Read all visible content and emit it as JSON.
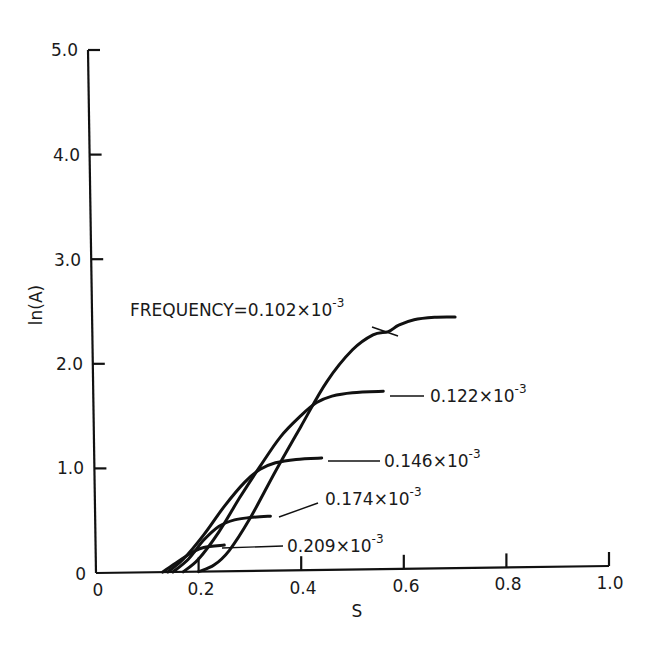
{
  "chart_data": {
    "type": "line",
    "title": "",
    "xlabel": "S",
    "ylabel": "ln(A)",
    "xlim": [
      0,
      1.0
    ],
    "ylim": [
      0,
      5.0
    ],
    "grid": false,
    "legend": "none (inline annotations with leader lines)",
    "x_ticks": [
      "0",
      "0.2",
      "0.4",
      "0.6",
      "0.8",
      "1.0"
    ],
    "x_tick_values": [
      0,
      0.2,
      0.4,
      0.6,
      0.8,
      1.0
    ],
    "y_ticks": [
      "0",
      "1.0",
      "2.0",
      "3.0",
      "4.0",
      "5.0"
    ],
    "y_tick_values": [
      0,
      1.0,
      2.0,
      3.0,
      4.0,
      5.0
    ],
    "series": [
      {
        "name": "0.102×10^-3",
        "label": "FREQUENCY=0.102×10",
        "exponent": "-3",
        "points": [
          [
            0.2,
            0.0
          ],
          [
            0.23,
            0.06
          ],
          [
            0.26,
            0.2
          ],
          [
            0.3,
            0.5
          ],
          [
            0.35,
            0.95
          ],
          [
            0.4,
            1.38
          ],
          [
            0.45,
            1.8
          ],
          [
            0.5,
            2.1
          ],
          [
            0.54,
            2.24
          ],
          [
            0.57,
            2.27
          ],
          [
            0.59,
            2.33
          ],
          [
            0.62,
            2.38
          ],
          [
            0.66,
            2.4
          ],
          [
            0.7,
            2.4
          ]
        ]
      },
      {
        "name": "0.122×10^-3",
        "label": "0.122×10",
        "exponent": "-3",
        "points": [
          [
            0.17,
            0.0
          ],
          [
            0.2,
            0.12
          ],
          [
            0.24,
            0.38
          ],
          [
            0.28,
            0.7
          ],
          [
            0.32,
            1.0
          ],
          [
            0.36,
            1.28
          ],
          [
            0.4,
            1.48
          ],
          [
            0.43,
            1.6
          ],
          [
            0.46,
            1.66
          ],
          [
            0.5,
            1.69
          ],
          [
            0.56,
            1.7
          ]
        ]
      },
      {
        "name": "0.146×10^-3",
        "label": "0.146×10",
        "exponent": "-3",
        "points": [
          [
            0.14,
            0.0
          ],
          [
            0.17,
            0.12
          ],
          [
            0.21,
            0.35
          ],
          [
            0.25,
            0.62
          ],
          [
            0.29,
            0.85
          ],
          [
            0.32,
            0.97
          ],
          [
            0.35,
            1.03
          ],
          [
            0.39,
            1.06
          ],
          [
            0.44,
            1.07
          ]
        ]
      },
      {
        "name": "0.174×10^-3",
        "label": "0.174×10",
        "exponent": "-3",
        "points": [
          [
            0.15,
            0.0
          ],
          [
            0.18,
            0.12
          ],
          [
            0.21,
            0.3
          ],
          [
            0.24,
            0.43
          ],
          [
            0.27,
            0.49
          ],
          [
            0.3,
            0.51
          ],
          [
            0.34,
            0.52
          ]
        ]
      },
      {
        "name": "0.209×10^-3",
        "label": "0.209×10",
        "exponent": "-3",
        "points": [
          [
            0.13,
            0.0
          ],
          [
            0.16,
            0.1
          ],
          [
            0.19,
            0.19
          ],
          [
            0.21,
            0.23
          ],
          [
            0.25,
            0.25
          ]
        ]
      }
    ],
    "annotations": [
      {
        "text": "FREQUENCY=0.102×10^-3",
        "target_series": "0.102×10^-3"
      },
      {
        "text": "0.122×10^-3",
        "target_series": "0.122×10^-3"
      },
      {
        "text": "0.146×10^-3",
        "target_series": "0.146×10^-3"
      },
      {
        "text": "0.174×10^-3",
        "target_series": "0.174×10^-3"
      },
      {
        "text": "0.209×10^-3",
        "target_series": "0.209×10^-3"
      }
    ],
    "colors": {
      "line": "#111111",
      "background": "#ffffff"
    }
  },
  "labels": {
    "xlabel": "S",
    "ylabel": "ln(A)",
    "x_ticks": [
      "0",
      "0.2",
      "0.4",
      "0.6",
      "0.8",
      "1.0"
    ],
    "y_ticks": [
      "0",
      "1.0",
      "2.0",
      "3.0",
      "4.0",
      "5.0"
    ],
    "annot": [
      {
        "base": "FREQUENCY=0.102×10",
        "exp": "-3"
      },
      {
        "base": "0.122×10",
        "exp": "-3"
      },
      {
        "base": "0.146×10",
        "exp": "-3"
      },
      {
        "base": "0.174×10",
        "exp": "-3"
      },
      {
        "base": "0.209×10",
        "exp": "-3"
      }
    ]
  }
}
